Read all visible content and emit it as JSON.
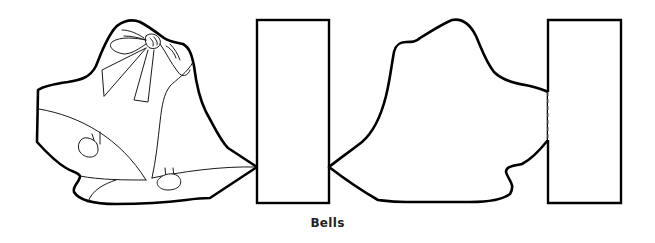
{
  "caption": "Bells",
  "parts": {
    "front": {
      "name": "decorated-bell-front",
      "description": "Two bells with bow outline (front panel)"
    },
    "back": {
      "name": "bell-back-silhouette",
      "description": "Plain bell silhouette (back panel)"
    },
    "tabs": [
      "center-fold-tab",
      "end-glue-tab"
    ],
    "fold_line": "dashed"
  },
  "colors": {
    "line": "#000000",
    "background": "#ffffff",
    "caption": "#222222"
  }
}
